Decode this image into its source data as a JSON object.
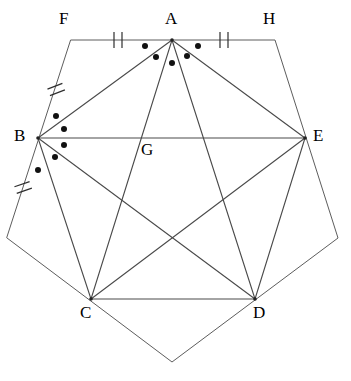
{
  "figure": {
    "canvas": {
      "width": 351,
      "height": 381
    },
    "stroke_color": "#565656",
    "label_color": "#000000",
    "dot_color": "#111111",
    "background": "#ffffff"
  },
  "labels": {
    "A": "A",
    "B": "B",
    "C": "C",
    "D": "D",
    "E": "E",
    "F": "F",
    "G": "G",
    "H": "H"
  },
  "label_positions": {
    "A": {
      "x": 165,
      "y": 10
    },
    "B": {
      "x": 14,
      "y": 127
    },
    "C": {
      "x": 80,
      "y": 304
    },
    "D": {
      "x": 253,
      "y": 304
    },
    "E": {
      "x": 313,
      "y": 127
    },
    "F": {
      "x": 59,
      "y": 10
    },
    "G": {
      "x": 141,
      "y": 141
    },
    "H": {
      "x": 263,
      "y": 10
    }
  },
  "vertices": {
    "A": {
      "x": 172,
      "y": 40
    },
    "B": {
      "x": 38,
      "y": 138
    },
    "C": {
      "x": 91,
      "y": 299
    },
    "D": {
      "x": 255,
      "y": 299
    },
    "E": {
      "x": 305,
      "y": 138
    },
    "F": {
      "x": 71,
      "y": 40
    },
    "G": {
      "x": 143,
      "y": 138
    },
    "H": {
      "x": 275,
      "y": 40
    },
    "P_left": {
      "x": 7,
      "y": 238
    },
    "P_bottom": {
      "x": 172,
      "y": 362
    },
    "P_right": {
      "x": 338,
      "y": 238
    }
  },
  "outer_pentagon": {
    "name": "outer-pentagon-FHRBL",
    "points": "71,40 275,40 338,238 172,362 7,238",
    "closed": true
  },
  "segments": [
    {
      "name": "segment-FA",
      "from": "F",
      "to": "A",
      "ticks": 2
    },
    {
      "name": "segment-AH",
      "from": "A",
      "to": "H",
      "ticks": 2
    },
    {
      "name": "segment-FB",
      "from": "F",
      "to": "B",
      "ticks": 2
    },
    {
      "name": "segment-B-lower-left",
      "from": "B",
      "to": "P_left",
      "ticks": 2
    },
    {
      "name": "segment-AB",
      "from": "A",
      "to": "B",
      "ticks": 0
    },
    {
      "name": "segment-AC",
      "from": "A",
      "to": "C",
      "ticks": 0
    },
    {
      "name": "segment-AD",
      "from": "A",
      "to": "D",
      "ticks": 0
    },
    {
      "name": "segment-AE",
      "from": "A",
      "to": "E",
      "ticks": 0
    },
    {
      "name": "segment-BE",
      "from": "B",
      "to": "E",
      "ticks": 0
    },
    {
      "name": "segment-BC",
      "from": "B",
      "to": "C",
      "ticks": 0
    },
    {
      "name": "segment-BD",
      "from": "B",
      "to": "D",
      "ticks": 0
    },
    {
      "name": "segment-CD",
      "from": "C",
      "to": "D",
      "ticks": 0
    },
    {
      "name": "segment-CE",
      "from": "C",
      "to": "E",
      "ticks": 0
    },
    {
      "name": "segment-DE",
      "from": "D",
      "to": "E",
      "ticks": 0
    },
    {
      "name": "segment-HE",
      "from": "H",
      "to": "E",
      "ticks": 0
    },
    {
      "name": "segment-E-lower-right",
      "from": "E",
      "to": "P_right",
      "ticks": 0
    },
    {
      "name": "segment-C-lower-bottom",
      "from": "C",
      "to": "P_bottom",
      "ticks": 0
    },
    {
      "name": "segment-D-lower-bottom",
      "from": "D",
      "to": "P_bottom",
      "ticks": 0
    }
  ],
  "tick_marks": [
    {
      "name": "tick-FA",
      "on": "segment-FA",
      "x": 118,
      "y": 40,
      "count": 2,
      "angle": 0
    },
    {
      "name": "tick-AH",
      "on": "segment-AH",
      "x": 224,
      "y": 40,
      "count": 2,
      "angle": 0
    },
    {
      "name": "tick-FB",
      "on": "segment-FB",
      "x": 56,
      "y": 89,
      "count": 2,
      "angle": -16
    },
    {
      "name": "tick-BL",
      "on": "segment-B-lower-left",
      "x": 23,
      "y": 187,
      "count": 2,
      "angle": -16
    }
  ],
  "angle_dots": {
    "at_A": {
      "name": "angle-dots-at-A",
      "count": 5,
      "points": [
        {
          "x": 145,
          "y": 46
        },
        {
          "x": 156,
          "y": 57
        },
        {
          "x": 172,
          "y": 63
        },
        {
          "x": 187,
          "y": 56
        },
        {
          "x": 198,
          "y": 46
        }
      ]
    },
    "at_B": {
      "name": "angle-dots-at-B",
      "count": 5,
      "points": [
        {
          "x": 56,
          "y": 116
        },
        {
          "x": 64,
          "y": 129
        },
        {
          "x": 64,
          "y": 145
        },
        {
          "x": 55,
          "y": 157
        },
        {
          "x": 38,
          "y": 170
        }
      ]
    }
  },
  "vertex_dots": [
    {
      "name": "vertex-dot-A",
      "x": 172,
      "y": 40
    },
    {
      "name": "vertex-dot-B",
      "x": 38,
      "y": 138
    },
    {
      "name": "vertex-dot-C",
      "x": 91,
      "y": 299
    },
    {
      "name": "vertex-dot-D",
      "x": 255,
      "y": 299
    },
    {
      "name": "vertex-dot-E",
      "x": 305,
      "y": 138
    }
  ]
}
